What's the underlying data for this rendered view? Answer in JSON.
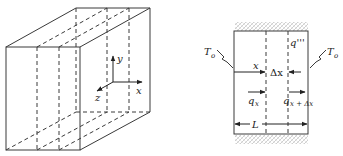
{
  "figure_left": {
    "title": "3D slab with internal heat generation",
    "axes": {
      "x_label": "x",
      "y_label": "y",
      "z_label": "z"
    }
  },
  "figure_right": {
    "title": "1D slab cross-section",
    "left_temp": {
      "symbol": "T",
      "subscript": "o"
    },
    "right_temp": {
      "symbol": "T",
      "subscript": "o"
    },
    "generation": "q'''",
    "x_label": "x",
    "delta_x_label": "Δx",
    "q_in": {
      "symbol": "q",
      "subscript": "x"
    },
    "q_out": {
      "symbol": "q",
      "subscript": "x + Δx"
    },
    "length_label": "L"
  },
  "colors": {
    "stroke": "#3a3a3a",
    "hatch": "#c8c8c8",
    "background": "#ffffff"
  }
}
